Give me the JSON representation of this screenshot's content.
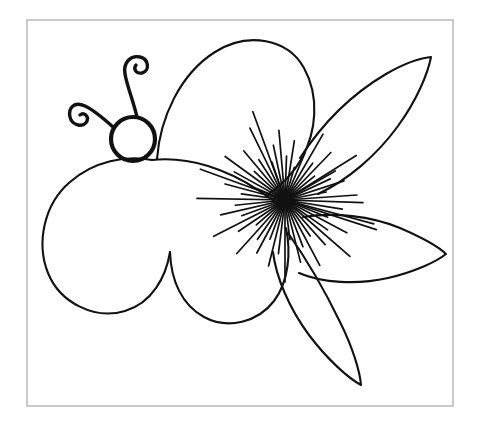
{
  "document": {
    "title": "Flower Butterfly Line Drawing",
    "kind": "coloring-page-line-art",
    "width": 486,
    "height": 427,
    "background_color": "#ffffff"
  },
  "frame": {
    "label": "image border",
    "x": 27,
    "y": 20,
    "width": 426,
    "height": 386,
    "stroke_color": "#bdbdbd",
    "stroke_width": 1.6
  },
  "ink": {
    "color": "#111111",
    "outline_width": 2.1,
    "head_width": 4.2,
    "antenna_width": 3.4,
    "stamen_width": 1.7
  },
  "subject": {
    "name": "butterfly-flower hybrid",
    "description": "Hand drawn black outline of a butterfly whose wings double as flower petals, with a round head, two spiral antennae, and a dense radial burst of stamens at the blossom center."
  },
  "head": {
    "label": "butterfly head",
    "center_x": 133,
    "center_y": 139,
    "radius": 22
  },
  "antennae": [
    {
      "label": "right antenna with clockwise spiral",
      "path": "M 137 117 C 133 100 127 86 125 74 C 123 62 131 55 140 57 C 149 59 150 71 142 73 C 136 74 133 69 136 65"
    },
    {
      "label": "left antenna with counter-clockwise spiral",
      "path": "M 113 127 C 103 118 94 110 85 106 C 74 101 68 108 70 117 C 72 126 84 128 87 121 C 89 116 84 112 80 115"
    }
  ],
  "petals": [
    {
      "label": "upper left large wing",
      "path": "M 157 159 C 160 118 180 74 215 52 C 248 31 288 39 304 68 C 320 97 316 132 302 158 C 292 176 278 188 266 196"
    },
    {
      "label": "lower left wing",
      "path": "M 152 160 C 126 155 94 161 70 182 C 44 204 36 243 48 273 C 60 303 95 320 125 311 C 152 303 166 277 170 252"
    },
    {
      "label": "lower middle wing",
      "path": "M 170 252 C 171 281 182 305 204 317 C 228 330 258 322 274 301 C 289 281 291 252 286 228"
    },
    {
      "label": "wing joining sweep from head to blossom",
      "path": "M 152 160 C 190 156 228 170 258 190 C 268 197 277 203 285 208"
    },
    {
      "label": "upper right pointed petal",
      "path": "M 300 158 C 322 124 352 94 386 74 C 405 63 420 58 431 57 C 428 73 417 100 398 126 C 377 155 348 180 318 194"
    },
    {
      "label": "middle right pointed petal",
      "path": "M 303 217 C 334 212 371 216 400 228 C 423 238 440 248 446 254 C 436 262 414 272 388 278 C 357 285 322 283 299 273"
    },
    {
      "label": "lower right pointed petal",
      "path": "M 288 233 C 305 257 325 291 340 322 C 353 348 360 372 361 385 C 348 378 327 359 309 335 C 289 308 276 277 273 252"
    }
  ],
  "stamens": {
    "label": "radial stamen burst at blossom center",
    "center_x": 285,
    "center_y": 200,
    "ray_count": 56,
    "min_length": 26,
    "max_length": 96,
    "note": "fine black radiating lines of varied length forming a dense starburst"
  },
  "stamen_rays": [
    {
      "angle": 2,
      "length": 78
    },
    {
      "angle": 9,
      "length": 58
    },
    {
      "angle": 15,
      "length": 92
    },
    {
      "angle": 22,
      "length": 46
    },
    {
      "angle": 28,
      "length": 70
    },
    {
      "angle": 35,
      "length": 52
    },
    {
      "angle": 41,
      "length": 86
    },
    {
      "angle": 48,
      "length": 60
    },
    {
      "angle": 55,
      "length": 44
    },
    {
      "angle": 62,
      "length": 74
    },
    {
      "angle": 69,
      "length": 50
    },
    {
      "angle": 76,
      "length": 64
    },
    {
      "angle": 83,
      "length": 40
    },
    {
      "angle": 90,
      "length": 82
    },
    {
      "angle": 97,
      "length": 54
    },
    {
      "angle": 104,
      "length": 68
    },
    {
      "angle": 111,
      "length": 42
    },
    {
      "angle": 118,
      "length": 60
    },
    {
      "angle": 125,
      "length": 48
    },
    {
      "angle": 132,
      "length": 72
    },
    {
      "angle": 139,
      "length": 38
    },
    {
      "angle": 146,
      "length": 56
    },
    {
      "angle": 153,
      "length": 80
    },
    {
      "angle": 160,
      "length": 46
    },
    {
      "angle": 167,
      "length": 66
    },
    {
      "angle": 174,
      "length": 50
    },
    {
      "angle": 181,
      "length": 88
    },
    {
      "angle": 188,
      "length": 44
    },
    {
      "angle": 195,
      "length": 62
    },
    {
      "angle": 202,
      "length": 36
    },
    {
      "angle": 209,
      "length": 58
    },
    {
      "angle": 216,
      "length": 74
    },
    {
      "angle": 223,
      "length": 42
    },
    {
      "angle": 230,
      "length": 64
    },
    {
      "angle": 237,
      "length": 48
    },
    {
      "angle": 244,
      "length": 80
    },
    {
      "angle": 251,
      "length": 40
    },
    {
      "angle": 258,
      "length": 56
    },
    {
      "angle": 265,
      "length": 70
    },
    {
      "angle": 272,
      "length": 44
    },
    {
      "angle": 279,
      "length": 60
    },
    {
      "angle": 286,
      "length": 34
    },
    {
      "angle": 293,
      "length": 52
    },
    {
      "angle": 300,
      "length": 76
    },
    {
      "angle": 307,
      "length": 46
    },
    {
      "angle": 314,
      "length": 66
    },
    {
      "angle": 321,
      "length": 38
    },
    {
      "angle": 328,
      "length": 84
    },
    {
      "angle": 335,
      "length": 50
    },
    {
      "angle": 342,
      "length": 62
    },
    {
      "angle": 349,
      "length": 42
    },
    {
      "angle": 356,
      "length": 72
    },
    {
      "angle": 18,
      "length": 96
    },
    {
      "angle": 200,
      "length": 90
    },
    {
      "angle": 250,
      "length": 94
    },
    {
      "angle": 330,
      "length": 58
    }
  ]
}
